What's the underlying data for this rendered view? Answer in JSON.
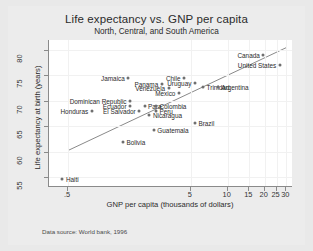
{
  "chart_data": {
    "type": "scatter",
    "title": "Life expectancy vs. GNP per capita",
    "subtitle": "North, Central, and South America",
    "xlabel": "GNP per capita (thousands of dollars)",
    "ylabel": "Life expectancy at birth (years)",
    "source_note": "Data source:  World bank, 1996",
    "xscale": "log",
    "xlim": [
      0.35,
      34
    ],
    "ylim": [
      53,
      82
    ],
    "xticks": [
      ".5",
      "5",
      "10",
      "15",
      "20",
      "25",
      "30"
    ],
    "xtick_values": [
      0.5,
      5,
      10,
      15,
      20,
      25,
      30
    ],
    "yticks": [
      "55",
      "60",
      "65",
      "70",
      "75",
      "80"
    ],
    "ytick_values": [
      55,
      60,
      65,
      70,
      75,
      80
    ],
    "grid": true,
    "legend": "none",
    "marker_color": "#6f6f6f",
    "fit_line": {
      "type": "linear-on-log-x",
      "x_start": 0.5,
      "y_start": 60.2,
      "x_end": 30,
      "y_end": 80.5
    },
    "points": [
      {
        "name": "Canada",
        "x": 19.5,
        "y": 79.0,
        "label_side": "left"
      },
      {
        "name": "United States",
        "x": 26.5,
        "y": 77.0,
        "label_side": "left"
      },
      {
        "name": "Jamaica",
        "x": 1.55,
        "y": 74.6,
        "label_side": "left"
      },
      {
        "name": "Chile",
        "x": 4.4,
        "y": 74.6,
        "label_side": "left"
      },
      {
        "name": "Uruguay",
        "x": 5.4,
        "y": 73.6,
        "label_side": "left"
      },
      {
        "name": "Panama",
        "x": 2.9,
        "y": 73.4,
        "label_side": "left"
      },
      {
        "name": "Venezuela",
        "x": 3.3,
        "y": 72.6,
        "label_side": "left"
      },
      {
        "name": "Trinidad",
        "x": 6.3,
        "y": 72.8,
        "label_side": "right"
      },
      {
        "name": "Argentina",
        "x": 8.3,
        "y": 72.8,
        "label_side": "right"
      },
      {
        "name": "Mexico",
        "x": 4.0,
        "y": 71.5,
        "label_side": "left"
      },
      {
        "name": "Dominican Republic",
        "x": 1.6,
        "y": 69.9,
        "label_side": "left"
      },
      {
        "name": "Ecuador",
        "x": 1.6,
        "y": 68.9,
        "label_side": "left"
      },
      {
        "name": "Para",
        "x": 2.1,
        "y": 68.9,
        "label_side": "right"
      },
      {
        "name": "Colombia",
        "x": 2.6,
        "y": 68.9,
        "label_side": "right"
      },
      {
        "name": "Honduras",
        "x": 0.78,
        "y": 68.0,
        "label_side": "left"
      },
      {
        "name": "El Salvador",
        "x": 1.9,
        "y": 68.0,
        "label_side": "left"
      },
      {
        "name": "Peru",
        "x": 2.6,
        "y": 68.0,
        "label_side": "right"
      },
      {
        "name": "Nicaragua",
        "x": 2.3,
        "y": 67.2,
        "label_side": "right"
      },
      {
        "name": "Brazil",
        "x": 5.4,
        "y": 65.6,
        "label_side": "right"
      },
      {
        "name": "Guatemala",
        "x": 2.5,
        "y": 64.2,
        "label_side": "right"
      },
      {
        "name": "Bolivia",
        "x": 1.4,
        "y": 61.8,
        "label_side": "right"
      },
      {
        "name": "Haiti",
        "x": 0.45,
        "y": 54.6,
        "label_side": "right"
      }
    ]
  }
}
